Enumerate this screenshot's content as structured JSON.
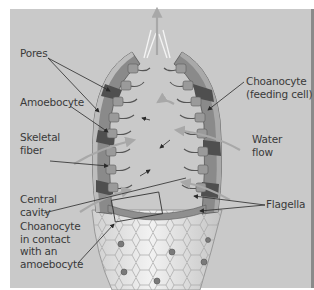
{
  "diagram": {
    "colors": {
      "background": "#c9c9c9",
      "label_text": "#3a3a3a",
      "leader_line": "#2a2a2a",
      "water_flow_arrow": "#a8a8a8",
      "body_wall": "#7d7d7d",
      "choanocyte_layer": "#5f5f5f",
      "outer_surface": "#e2e2e2"
    },
    "labels": {
      "pores": "Pores",
      "amoebocyte": "Amoebocyte",
      "skeletal_fiber": "Skeletal\nfiber",
      "central_cavity": "Central\ncavity",
      "choanocyte_contact": "Choanocyte\nin contact\nwith an\namoebocyte",
      "choanocyte_feeding": "Choanocyte\n(feeding cell)",
      "water_flow": "Water\nflow",
      "flagella": "Flagella"
    }
  }
}
